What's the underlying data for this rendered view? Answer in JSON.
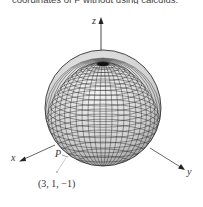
{
  "caption": "coordinates of P without using calculus.",
  "figure": {
    "type": "sphere-3d-axes",
    "axes": {
      "x": "x",
      "y": "y",
      "z": "z"
    },
    "point_label": "P",
    "external_point_label": "(3, 1, −1)",
    "colors": {
      "axis": "#333333",
      "mesh": "#2a2a2a",
      "sphere_fill": "#d8d8d8",
      "guide_line": "#c8c8c8"
    }
  }
}
